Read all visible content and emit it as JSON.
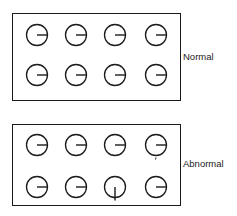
{
  "figure": {
    "panels": [
      {
        "id": "normal",
        "label": "Normal",
        "rows": [
          [
            {
              "hand": "right"
            },
            {
              "hand": "right"
            },
            {
              "hand": "right"
            },
            {
              "hand": "right"
            }
          ],
          [
            {
              "hand": "right"
            },
            {
              "hand": "right"
            },
            {
              "hand": "right"
            },
            {
              "hand": "right"
            }
          ]
        ]
      },
      {
        "id": "abnormal",
        "label": "Abnormal",
        "rows": [
          [
            {
              "hand": "right"
            },
            {
              "hand": "right"
            },
            {
              "hand": "right"
            },
            {
              "hand": "right",
              "tick": "bottom"
            }
          ],
          [
            {
              "hand": "right"
            },
            {
              "hand": "right"
            },
            {
              "hand": "down"
            },
            {
              "hand": "right"
            }
          ]
        ]
      }
    ],
    "colors": {
      "stroke": "#1a1a1a",
      "background": "#ffffff"
    }
  }
}
